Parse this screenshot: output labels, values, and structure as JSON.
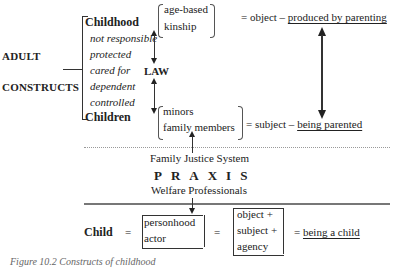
{
  "left_labels": {
    "top": "ADULT",
    "bottom": "CONSTRUCTS"
  },
  "constructs": {
    "heading_top": "Childhood",
    "attributes": [
      "not responsible",
      "protected",
      "cared for",
      "dependent",
      "controlled"
    ],
    "heading_bottom": "Children"
  },
  "law": {
    "label": "LAW"
  },
  "childhood_group": {
    "items": [
      "age-based",
      "kinship"
    ],
    "equals": "= object –",
    "result": "produced by parenting"
  },
  "children_group": {
    "items": [
      "minors",
      "family members"
    ],
    "equals": "= subject –",
    "result": "being parented"
  },
  "praxis": {
    "top": "Family Justice System",
    "title": "PRAXIS",
    "bottom": "Welfare Professionals"
  },
  "child_equation": {
    "term": "Child",
    "eq1": "=",
    "bracket1": [
      "personhood",
      "actor"
    ],
    "eq2": "=",
    "bracket2": [
      "object +",
      "subject +",
      "agency"
    ],
    "eq3": "=",
    "result": "being a child"
  },
  "caption": "Figure 10.2  Constructs of childhood"
}
